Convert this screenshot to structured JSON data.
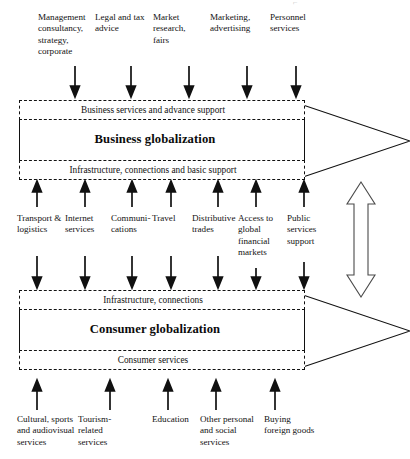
{
  "diagram": {
    "top_inputs": [
      {
        "id": "management-consultancy",
        "label": "Management consultancy, strategy, corporate",
        "x": 38,
        "y": 12,
        "width": 54,
        "arrow_x": 75
      },
      {
        "id": "legal-and-tax-advice",
        "label": "Legal and tax advice",
        "x": 95,
        "y": 12,
        "width": 52,
        "arrow_x": 131
      },
      {
        "id": "market-research-fairs",
        "label": "Market research, fairs",
        "x": 153,
        "y": 12,
        "width": 45,
        "arrow_x": 189
      },
      {
        "id": "marketing-advertising",
        "label": "Marketing, advertising",
        "x": 210,
        "y": 12,
        "width": 50,
        "arrow_x": 247
      },
      {
        "id": "personnel-services",
        "label": "Personnel services",
        "x": 270,
        "y": 12,
        "width": 48,
        "arrow_x": 296
      }
    ],
    "business_block": {
      "top_band_label": "Business services and advance support",
      "title": "Business globalization",
      "bottom_band_label": "Infrastructure, connections and basic support"
    },
    "middle_inputs": [
      {
        "id": "transport-logistics",
        "label": "Transport & logistics",
        "x": 17,
        "y": 213,
        "width": 50,
        "arrow_x": 37
      },
      {
        "id": "internet-services",
        "label": "Internet services",
        "x": 65,
        "y": 213,
        "width": 44,
        "arrow_x": 85
      },
      {
        "id": "communications",
        "label": "Communi- cations",
        "x": 111,
        "y": 213,
        "width": 44,
        "arrow_x": 132
      },
      {
        "id": "travel",
        "label": "Travel",
        "x": 152,
        "y": 213,
        "width": 36,
        "arrow_x": 171
      },
      {
        "id": "distributive-trades",
        "label": "Distributive trades",
        "x": 192,
        "y": 213,
        "width": 48,
        "arrow_x": 218
      },
      {
        "id": "access-to-global-financial-markets",
        "label": "Access to global financial markets",
        "x": 238,
        "y": 213,
        "width": 44,
        "arrow_x": 256
      },
      {
        "id": "public-services-support",
        "label": "Public services support",
        "x": 287,
        "y": 213,
        "width": 40,
        "arrow_x": 304
      }
    ],
    "consumer_block": {
      "top_band_label": "Infrastructure, connections",
      "title": "Consumer globalization",
      "bottom_band_label": "Consumer services"
    },
    "bottom_inputs": [
      {
        "id": "cultural-sports-audiovisual",
        "label": "Cultural, sports and audiovisual services",
        "x": 17,
        "y": 414,
        "width": 58,
        "arrow_x": 37
      },
      {
        "id": "tourism-related-services",
        "label": "Tourism-related services",
        "x": 78,
        "y": 414,
        "width": 52,
        "arrow_x": 110
      },
      {
        "id": "education",
        "label": "Education",
        "x": 152,
        "y": 414,
        "width": 44,
        "arrow_x": 168
      },
      {
        "id": "other-personal-and-social-services",
        "label": "Other personal and social services",
        "x": 200,
        "y": 414,
        "width": 52,
        "arrow_x": 216
      },
      {
        "id": "buying-foreign-goods",
        "label": "Buying foreign goods",
        "x": 264,
        "y": 414,
        "width": 50,
        "arrow_x": 275
      }
    ],
    "vertical_link": {
      "name": "bidirectional-link-arrow",
      "description": "hollow double-headed vertical arrow linking business and consumer globalization"
    },
    "colors": {
      "ink": "#111111",
      "background": "#ffffff",
      "faint": "#b9b9b9"
    }
  }
}
